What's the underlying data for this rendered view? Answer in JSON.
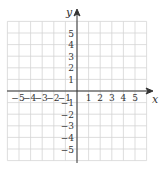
{
  "chart_data": {
    "type": "coordinate-grid",
    "title": "",
    "xlabel": "x",
    "ylabel": "y",
    "xlim": [
      -6,
      6
    ],
    "ylim": [
      -6,
      6
    ],
    "grid": true,
    "x_tick_labels": [
      "-5",
      "-4",
      "-3",
      "-2",
      "-1",
      "1",
      "2",
      "3",
      "4",
      "5"
    ],
    "y_tick_labels": [
      "5",
      "4",
      "3",
      "2",
      "1",
      "-1",
      "-2",
      "-3",
      "-4",
      "-5"
    ],
    "x_ticks": [
      -5,
      -4,
      -3,
      -2,
      -1,
      1,
      2,
      3,
      4,
      5
    ],
    "y_ticks": [
      5,
      4,
      3,
      2,
      1,
      -1,
      -2,
      -3,
      -4,
      -5
    ],
    "data": []
  },
  "colors": {
    "grid": "#d4d4d4",
    "axis": "#333333",
    "background": "#ffffff"
  }
}
